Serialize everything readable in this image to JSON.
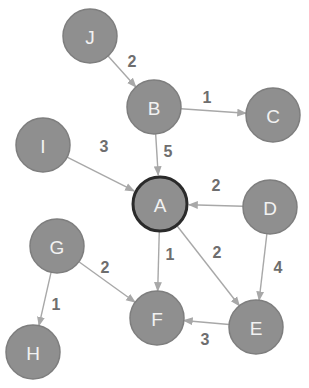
{
  "graph": {
    "type": "directed-weighted",
    "colors": {
      "node_fill": "#8f8f8f",
      "node_text": "#f2f2f2",
      "edge": "#a8a8a8",
      "weight_text": "#6e6e6e",
      "highlight_border": "#2a2a2a"
    },
    "nodes": [
      {
        "id": "J",
        "label": "J",
        "x": 90,
        "y": 36,
        "highlight": false
      },
      {
        "id": "B",
        "label": "B",
        "x": 154,
        "y": 107,
        "highlight": false
      },
      {
        "id": "C",
        "label": "C",
        "x": 273,
        "y": 115,
        "highlight": false
      },
      {
        "id": "I",
        "label": "I",
        "x": 43,
        "y": 145,
        "highlight": false
      },
      {
        "id": "A",
        "label": "A",
        "x": 160,
        "y": 204,
        "highlight": true
      },
      {
        "id": "D",
        "label": "D",
        "x": 270,
        "y": 207,
        "highlight": false
      },
      {
        "id": "G",
        "label": "G",
        "x": 57,
        "y": 246,
        "highlight": false
      },
      {
        "id": "F",
        "label": "F",
        "x": 157,
        "y": 318,
        "highlight": false
      },
      {
        "id": "E",
        "label": "E",
        "x": 256,
        "y": 327,
        "highlight": false
      },
      {
        "id": "H",
        "label": "H",
        "x": 33,
        "y": 352,
        "highlight": false
      }
    ],
    "edges": [
      {
        "from": "J",
        "to": "B",
        "weight": "2",
        "lx": 132,
        "ly": 61
      },
      {
        "from": "B",
        "to": "C",
        "weight": "1",
        "lx": 207,
        "ly": 97
      },
      {
        "from": "B",
        "to": "A",
        "weight": "5",
        "lx": 168,
        "ly": 151
      },
      {
        "from": "I",
        "to": "A",
        "weight": "3",
        "lx": 104,
        "ly": 146
      },
      {
        "from": "D",
        "to": "A",
        "weight": "2",
        "lx": 216,
        "ly": 185
      },
      {
        "from": "A",
        "to": "F",
        "weight": "1",
        "lx": 170,
        "ly": 254
      },
      {
        "from": "A",
        "to": "E",
        "weight": "2",
        "lx": 217,
        "ly": 252
      },
      {
        "from": "D",
        "to": "E",
        "weight": "4",
        "lx": 278,
        "ly": 267
      },
      {
        "from": "G",
        "to": "F",
        "weight": "2",
        "lx": 105,
        "ly": 267
      },
      {
        "from": "G",
        "to": "H",
        "weight": "1",
        "lx": 56,
        "ly": 304
      },
      {
        "from": "E",
        "to": "F",
        "weight": "3",
        "lx": 205,
        "ly": 339
      }
    ]
  }
}
